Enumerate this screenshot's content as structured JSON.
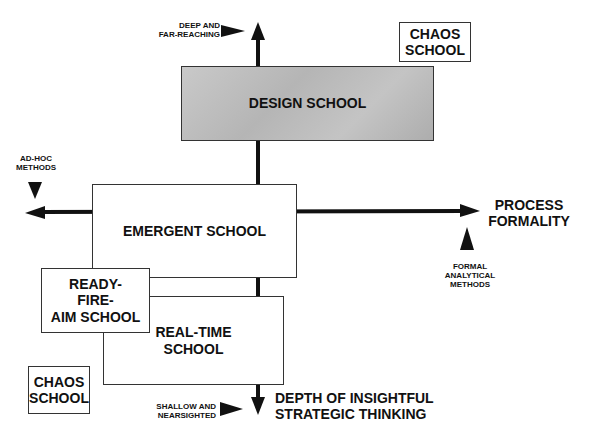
{
  "diagram": {
    "axes": {
      "vertical": {
        "top_end_label": "DEEP AND\nFAR-REACHING",
        "bottom_end_label": "SHALLOW AND\nNEARSIGHTED",
        "title": "DEPTH OF INSIGHTFUL\nSTRATEGIC THINKING"
      },
      "horizontal": {
        "left_end_label": "AD-HOC\nMETHODS",
        "right_end_label": "FORMAL\nANALYTICAL\nMETHODS",
        "title": "PROCESS\nFORMALITY"
      }
    },
    "schools": {
      "design": "DESIGN SCHOOL",
      "emergent": "EMERGENT SCHOOL",
      "ready_fire_aim": "READY-\nFIRE-\nAIM SCHOOL",
      "real_time": "REAL-TIME\nSCHOOL",
      "chaos_top": "CHAOS\nSCHOOL",
      "chaos_bottom": "CHAOS\nSCHOOL"
    },
    "colors": {
      "line": "#111111",
      "design_fill": "#bdbdbd",
      "box_border": "#333333"
    }
  }
}
